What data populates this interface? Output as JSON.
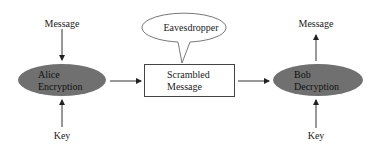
{
  "diagram": {
    "type": "encryption-flow",
    "colors": {
      "node_fill": "#707070",
      "stroke": "#333333",
      "background": "#ffffff"
    },
    "nodes": [
      {
        "id": "alice",
        "label_line1": "Alice",
        "label_line2": "Encryption",
        "shape": "ellipse"
      },
      {
        "id": "scrambled",
        "label_line1": "Scrambled",
        "label_line2": "Message",
        "shape": "rectangle"
      },
      {
        "id": "bob",
        "label_line1": "Bob",
        "label_line2": "Decryption",
        "shape": "ellipse"
      },
      {
        "id": "eavesdropper",
        "label": "Eavesdropper",
        "shape": "speech-bubble"
      }
    ],
    "inputs": {
      "alice_message": "Message",
      "alice_key": "Key",
      "bob_message": "Message",
      "bob_key": "Key"
    },
    "edges": [
      {
        "from": "Message",
        "to": "Alice Encryption"
      },
      {
        "from": "Key",
        "to": "Alice Encryption"
      },
      {
        "from": "Alice Encryption",
        "to": "Scrambled Message"
      },
      {
        "from": "Scrambled Message",
        "to": "Bob Decryption"
      },
      {
        "from": "Key",
        "to": "Bob Decryption"
      },
      {
        "from": "Bob Decryption",
        "to": "Message"
      }
    ]
  }
}
